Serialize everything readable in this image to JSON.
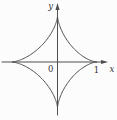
{
  "figure": {
    "curve": {
      "type": "astroid",
      "equation": "x^(2/3) + y^(2/3) = 1",
      "cusps_math_units": [
        [
          1,
          0
        ],
        [
          0,
          1
        ],
        [
          -1,
          0
        ],
        [
          0,
          -1
        ]
      ]
    },
    "labels": {
      "y_axis": "y",
      "x_axis": "x",
      "origin": "0",
      "x_tick": "1"
    },
    "colors": {
      "background": "#fcfcfc",
      "stroke": "#4f4f4f",
      "label": "#333333"
    },
    "geometry": {
      "cx": 57.5,
      "cy": 62,
      "rx_right": 39,
      "rx_left": 45.5,
      "ry_top": 46,
      "ry_bottom": 46,
      "x_axis_start": 2,
      "x_axis_end": 105,
      "x_arrow_tip": 108,
      "y_axis_bottom": 115,
      "y_axis_top": 6,
      "y_arrow_tip": 3
    }
  }
}
